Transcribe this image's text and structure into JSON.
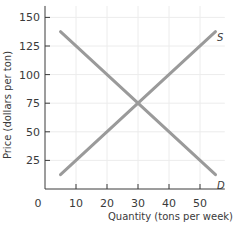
{
  "chart_data": {
    "type": "line",
    "title": "",
    "xlabel": "Quantity (tons per week)",
    "ylabel": "Price (dollars per ton)",
    "xlim": [
      0,
      58
    ],
    "ylim": [
      0,
      160
    ],
    "x_ticks": [
      0,
      10,
      20,
      30,
      40,
      50
    ],
    "y_ticks": [
      25,
      50,
      75,
      100,
      125,
      150
    ],
    "grid": true,
    "series": [
      {
        "name": "S",
        "label": "S",
        "x": [
          5,
          55
        ],
        "y": [
          12.5,
          137.5
        ]
      },
      {
        "name": "D",
        "label": "D",
        "x": [
          5,
          55
        ],
        "y": [
          137.5,
          12.5
        ]
      }
    ],
    "equilibrium": {
      "quantity": 30,
      "price": 75
    }
  },
  "labels": {
    "origin": "0",
    "x_title": "Quantity (tons per week)",
    "y_title": "Price (dollars per ton)",
    "supply": "S",
    "demand": "D"
  },
  "colors": {
    "line": "#9a9a9a",
    "axis": "#3a3a3a",
    "grid": "#ececec"
  }
}
